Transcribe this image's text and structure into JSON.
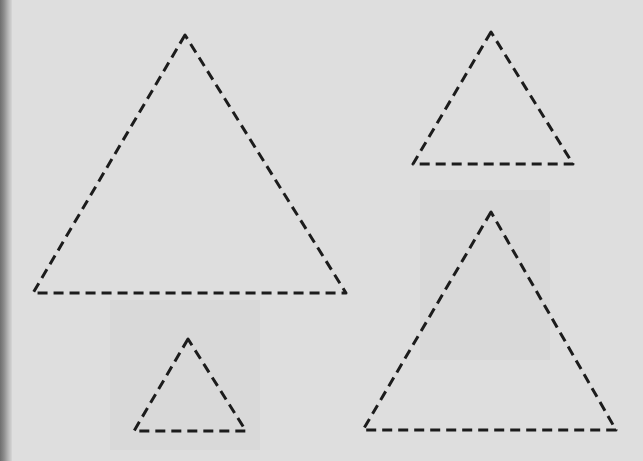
{
  "page": {
    "background_color": "#dedede",
    "stroke_color": "#1c1c1c"
  },
  "triangles": [
    {
      "id": "large-top-left",
      "points": [
        [
          185,
          35
        ],
        [
          33,
          293
        ],
        [
          346,
          293
        ]
      ]
    },
    {
      "id": "medium-top-right",
      "points": [
        [
          491,
          32
        ],
        [
          413,
          164
        ],
        [
          573,
          164
        ]
      ]
    },
    {
      "id": "small-bottom-left",
      "points": [
        [
          188,
          339
        ],
        [
          134,
          431
        ],
        [
          246,
          431
        ]
      ]
    },
    {
      "id": "large-bottom-right",
      "points": [
        [
          491,
          212
        ],
        [
          363,
          430
        ],
        [
          616,
          430
        ]
      ]
    }
  ]
}
